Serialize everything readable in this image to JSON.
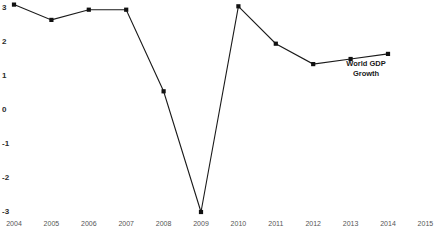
{
  "chart_data": {
    "type": "line",
    "title": "",
    "subtitle": "",
    "xlabel": "",
    "ylabel": "",
    "categories": [
      "2004",
      "2005",
      "2006",
      "2007",
      "2008",
      "2009",
      "2010",
      "2011",
      "2012",
      "2013",
      "2014",
      "2015"
    ],
    "x_tick_labels": [
      "2004",
      "2005",
      "2006",
      "2007",
      "2008",
      "2009",
      "2010",
      "2011",
      "2012",
      "2013",
      "2014",
      "2015"
    ],
    "y_tick_labels": [
      "3",
      "2",
      "1",
      "0",
      "-1",
      "-2",
      "-3"
    ],
    "y_tick_values": [
      3,
      2,
      1,
      0,
      -1,
      -2,
      -3
    ],
    "ylim": [
      -3,
      3.1
    ],
    "xlim": [
      "2004",
      "2015"
    ],
    "grid": false,
    "legend_position": "inline-right",
    "series": [
      {
        "name": "World GDP Growth",
        "color": "#1a1a1a",
        "marker": "square",
        "x": [
          "2004",
          "2005",
          "2006",
          "2007",
          "2008",
          "2009",
          "2010",
          "2011",
          "2012",
          "2013",
          "2014"
        ],
        "values": [
          3.1,
          2.65,
          2.95,
          2.95,
          0.55,
          -3.0,
          3.05,
          1.95,
          1.35,
          1.5,
          1.65
        ]
      }
    ],
    "annotations": [
      {
        "text": "World GDP\nGrowth",
        "line1": "World GDP",
        "line2": "Growth",
        "attached_to": "World GDP Growth"
      }
    ]
  },
  "axes": {
    "y_axis_label": "",
    "x_axis_label": ""
  }
}
